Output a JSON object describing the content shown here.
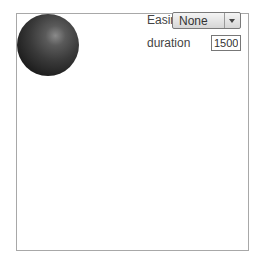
{
  "controls": {
    "easing_label": "Easing",
    "easing_value": "None",
    "duration_label": "duration",
    "duration_value": "1500"
  },
  "icons": {
    "dropdown": "chevron-down-icon",
    "ball": "sphere"
  }
}
